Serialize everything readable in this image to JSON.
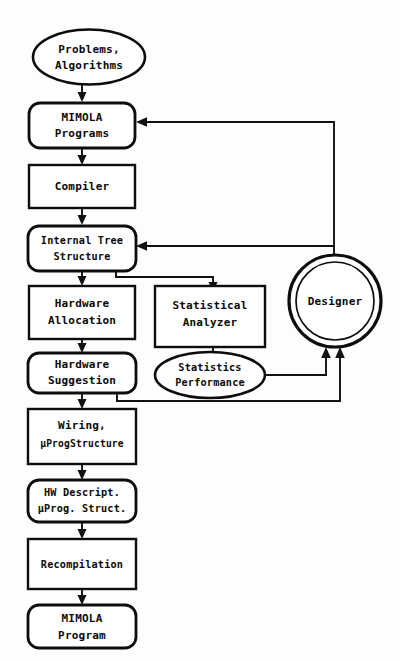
{
  "diagram": {
    "background_color": "#fdfdfd",
    "line_color": "#111111",
    "text_color": "#0a0a0a",
    "nodes": [
      {
        "id": "problems",
        "label_line1": "Problems,",
        "label_line2": "Algorithms",
        "shape": "ellipse"
      },
      {
        "id": "mimola_prog",
        "label_line1": "MIMOLA",
        "label_line2": "Programs",
        "shape": "rounded-rect"
      },
      {
        "id": "compiler",
        "label_line1": "Compiler",
        "label_line2": "",
        "shape": "rect"
      },
      {
        "id": "tree",
        "label_line1": "Internal Tree",
        "label_line2": "Structure",
        "shape": "rounded-rect"
      },
      {
        "id": "hw_alloc",
        "label_line1": "Hardware",
        "label_line2": "Allocation",
        "shape": "rect"
      },
      {
        "id": "hw_sugg",
        "label_line1": "Hardware",
        "label_line2": "Suggestion",
        "shape": "rounded-rect"
      },
      {
        "id": "stat_anal",
        "label_line1": "Statistical",
        "label_line2": "Analyzer",
        "shape": "rect"
      },
      {
        "id": "stat_perf",
        "label_line1": "Statistics",
        "label_line2": "Performance",
        "shape": "ellipse"
      },
      {
        "id": "designer",
        "label_line1": "Designer",
        "label_line2": "",
        "shape": "double-circle"
      },
      {
        "id": "wiring",
        "label_line1": "Wiring,",
        "label_line2": "µProgStructure",
        "shape": "rect"
      },
      {
        "id": "hw_descr",
        "label_line1": "HW Descript.",
        "label_line2": "µProg. Struct.",
        "shape": "rounded-rect"
      },
      {
        "id": "recompile",
        "label_line1": "Recompilation",
        "label_line2": "",
        "shape": "rect"
      },
      {
        "id": "mimola_out",
        "label_line1": "MIMOLA",
        "label_line2": "Program",
        "shape": "rounded-rect"
      }
    ],
    "edges": [
      {
        "from": "problems",
        "to": "mimola_prog",
        "kind": "arrow-down"
      },
      {
        "from": "mimola_prog",
        "to": "compiler",
        "kind": "arrow-down"
      },
      {
        "from": "compiler",
        "to": "tree",
        "kind": "arrow-down"
      },
      {
        "from": "tree",
        "to": "hw_alloc",
        "kind": "arrow-down"
      },
      {
        "from": "hw_alloc",
        "to": "hw_sugg",
        "kind": "arrow-down"
      },
      {
        "from": "hw_sugg",
        "to": "wiring",
        "kind": "arrow-down"
      },
      {
        "from": "wiring",
        "to": "hw_descr",
        "kind": "arrow-down"
      },
      {
        "from": "hw_descr",
        "to": "recompile",
        "kind": "arrow-down"
      },
      {
        "from": "recompile",
        "to": "mimola_out",
        "kind": "arrow-down"
      },
      {
        "from": "tree",
        "to": "stat_anal",
        "kind": "elbow-right-down"
      },
      {
        "from": "stat_anal",
        "to": "stat_perf",
        "kind": "arrow-down"
      },
      {
        "from": "stat_perf",
        "to": "designer",
        "kind": "elbow-right-up"
      },
      {
        "from": "hw_sugg",
        "to": "designer",
        "kind": "elbow-right-up"
      },
      {
        "from": "designer",
        "to": "mimola_prog",
        "kind": "feedback-up-left"
      },
      {
        "from": "designer",
        "to": "tree",
        "kind": "feedback-left"
      }
    ]
  }
}
